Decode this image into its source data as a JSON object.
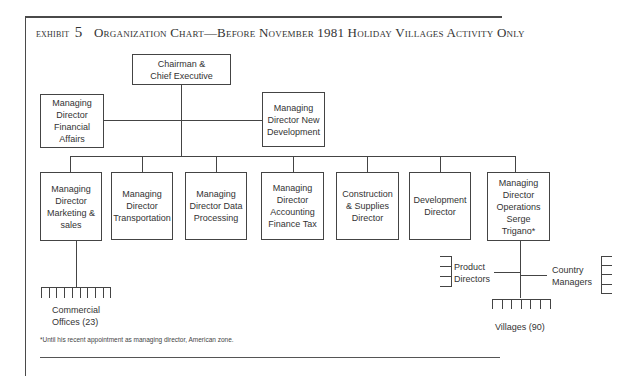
{
  "exhibit": {
    "label": "exhibit",
    "number": "5",
    "title": "Organization Chart—Before November 1981 Holiday Villages Activity Only"
  },
  "chart": {
    "top": {
      "label": "Chairman &\nChief Executive"
    },
    "staff": [
      {
        "label": "Managing\nDirector\nFinancial\nAffairs"
      },
      {
        "label": "Managing\nDirector New\nDevelopment"
      }
    ],
    "reports": [
      {
        "label": "Managing\nDirector\nMarketing &\nsales"
      },
      {
        "label": "Managing\nDirector\nTransportation"
      },
      {
        "label": "Managing\nDirector Data\nProcessing"
      },
      {
        "label": "Managing\nDirector\nAccounting\nFinance Tax"
      },
      {
        "label": "Construction\n& Supplies\nDirector"
      },
      {
        "label": "Development\nDirector"
      },
      {
        "label": "Managing\nDirector\nOperations\nSerge\nTrigano*"
      }
    ],
    "sub_units": {
      "commercial_offices": "Commercial\nOffices (23)",
      "product_directors": "Product\nDirectors",
      "country_managers": "Country\nManagers",
      "villages": "Villages (90)"
    }
  },
  "footnote": "*Until his recent appointment as managing director, American zone."
}
